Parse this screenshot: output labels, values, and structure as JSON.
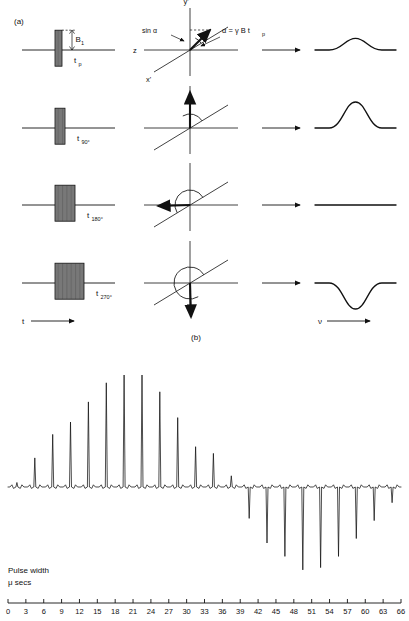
{
  "figure": {
    "panel_a_label": "(a)",
    "panel_b_label": "(b)",
    "time_axis_label": "t",
    "freq_axis_label": "ν",
    "amplitude_label": "B",
    "amplitude_sub": "1",
    "relation_label": "α = γ B t",
    "relation_sub": "p",
    "sine_label": "sin α",
    "axis_y": "y'",
    "axis_x": "x'",
    "axis_z": "z"
  },
  "rows": [
    {
      "pulse_label_main": "t",
      "pulse_label_sub": "p",
      "pulse_width": 7,
      "flip_angle_deg": 35,
      "arc_sweep_deg": 35,
      "spectrum": "small-positive-peak",
      "peak_sign": "positive",
      "peak_amplitude": 0.45
    },
    {
      "pulse_label_main": "t",
      "pulse_label_sub": "90°",
      "pulse_width": 10,
      "flip_angle_deg": 90,
      "arc_sweep_deg": 90,
      "spectrum": "large-positive-peak",
      "peak_sign": "positive",
      "peak_amplitude": 1.0
    },
    {
      "pulse_label_main": "t",
      "pulse_label_sub": "180°",
      "pulse_width": 20,
      "flip_angle_deg": 180,
      "arc_sweep_deg": 180,
      "spectrum": "null-flat-line",
      "peak_sign": "none",
      "peak_amplitude": 0.0
    },
    {
      "pulse_label_main": "t",
      "pulse_label_sub": "270°",
      "pulse_width": 29,
      "flip_angle_deg": 270,
      "arc_sweep_deg": 270,
      "spectrum": "large-negative-peak",
      "peak_sign": "negative",
      "peak_amplitude": -1.0
    }
  ],
  "nutation_plot": {
    "xlabel_line1": "Pulse width",
    "xlabel_line2": "μ secs",
    "axis_min": 0,
    "axis_max": 66,
    "tick_step": 3,
    "ticks": [
      0,
      3,
      6,
      9,
      12,
      15,
      18,
      21,
      24,
      27,
      30,
      33,
      36,
      39,
      42,
      45,
      48,
      51,
      54,
      57,
      60,
      63,
      66
    ]
  },
  "chart_data": {
    "type": "line",
    "title": "",
    "xlabel": "Pulse width μ secs",
    "ylabel": "",
    "xlim": [
      0,
      66
    ],
    "grid": false,
    "legend": "none",
    "x": [
      1.5,
      4.5,
      7.5,
      10.5,
      13.5,
      16.5,
      19.5,
      22.5,
      25.5,
      28.5,
      31.5,
      34.5,
      37.5,
      40.5,
      43.5,
      46.5,
      49.5,
      52.5,
      55.5,
      58.5,
      61.5,
      64.5
    ],
    "values": [
      0.04,
      0.26,
      0.47,
      0.58,
      0.76,
      0.93,
      1.0,
      1.0,
      0.85,
      0.62,
      0.36,
      0.3,
      0.1,
      -0.28,
      -0.5,
      -0.62,
      -0.74,
      -0.72,
      -0.62,
      -0.46,
      -0.3,
      -0.14,
      -0.1
    ],
    "categories": [
      "0",
      "3",
      "6",
      "9",
      "12",
      "15",
      "18",
      "21",
      "24",
      "27",
      "30",
      "33",
      "36",
      "39",
      "42",
      "45",
      "48",
      "51",
      "54",
      "57",
      "60",
      "63",
      "66"
    ]
  },
  "colors": {
    "ink": "#111111",
    "background": "#ffffff",
    "pulse_fill": "#4a4a4a"
  }
}
